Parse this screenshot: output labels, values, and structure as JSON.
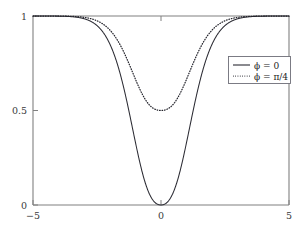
{
  "chart_data": {
    "type": "line",
    "title": "",
    "subtitle": "",
    "xlabel": "",
    "ylabel": "",
    "xlim": [
      -5,
      5
    ],
    "ylim": [
      0,
      1
    ],
    "xticks": [
      -5,
      0,
      5
    ],
    "xtick_labels": [
      "−5",
      "0",
      "5"
    ],
    "yticks": [
      0,
      0.5,
      1
    ],
    "ytick_labels": [
      "0",
      "0.5",
      "1"
    ],
    "grid": false,
    "legend_position": "upper right",
    "series": [
      {
        "name": "ϕ = 0",
        "style": "solid",
        "color": "#2b2b33",
        "minimum": 0.0,
        "minimum_at_x": 0,
        "asymptote": 1.0,
        "x": [
          -5.0,
          -4.75,
          -4.5,
          -4.25,
          -4.0,
          -3.75,
          -3.5,
          -3.25,
          -3.0,
          -2.75,
          -2.5,
          -2.25,
          -2.0,
          -1.75,
          -1.5,
          -1.25,
          -1.0,
          -0.9,
          -0.8,
          -0.7,
          -0.6,
          -0.5,
          -0.4,
          -0.3,
          -0.2,
          -0.1,
          0.0,
          0.1,
          0.2,
          0.3,
          0.4,
          0.5,
          0.6,
          0.7,
          0.8,
          0.9,
          1.0,
          1.25,
          1.5,
          1.75,
          2.0,
          2.25,
          2.5,
          2.75,
          3.0,
          3.25,
          3.5,
          3.75,
          4.0,
          4.25,
          4.5,
          4.75,
          5.0
        ],
        "y": [
          1.0,
          1.0,
          1.0,
          0.999,
          0.999,
          0.998,
          0.997,
          0.995,
          0.992,
          0.988,
          0.981,
          0.97,
          0.954,
          0.929,
          0.891,
          0.835,
          0.757,
          0.719,
          0.676,
          0.628,
          0.575,
          0.517,
          0.453,
          0.383,
          0.305,
          0.216,
          0.0,
          0.216,
          0.305,
          0.383,
          0.453,
          0.517,
          0.575,
          0.628,
          0.676,
          0.719,
          0.757,
          0.835,
          0.891,
          0.929,
          0.954,
          0.97,
          0.981,
          0.988,
          0.992,
          0.995,
          0.997,
          0.998,
          0.999,
          0.999,
          1.0,
          1.0,
          1.0
        ]
      },
      {
        "name": "ϕ = π/4",
        "style": "dotted",
        "color": "#23232b",
        "minimum": 0.5,
        "minimum_at_x": 0,
        "asymptote": 1.0,
        "x": [
          -5.0,
          -4.75,
          -4.5,
          -4.25,
          -4.0,
          -3.75,
          -3.5,
          -3.25,
          -3.0,
          -2.75,
          -2.5,
          -2.25,
          -2.0,
          -1.75,
          -1.5,
          -1.25,
          -1.0,
          -0.9,
          -0.8,
          -0.7,
          -0.6,
          -0.5,
          -0.4,
          -0.3,
          -0.2,
          -0.1,
          0.0,
          0.1,
          0.2,
          0.3,
          0.4,
          0.5,
          0.6,
          0.7,
          0.8,
          0.9,
          1.0,
          1.25,
          1.5,
          1.75,
          2.0,
          2.25,
          2.5,
          2.75,
          3.0,
          3.25,
          3.5,
          3.75,
          4.0,
          4.25,
          4.5,
          4.75,
          5.0
        ],
        "y": [
          1.0,
          1.0,
          0.999,
          0.999,
          0.998,
          0.997,
          0.995,
          0.992,
          0.988,
          0.982,
          0.973,
          0.959,
          0.939,
          0.909,
          0.868,
          0.812,
          0.742,
          0.711,
          0.679,
          0.645,
          0.612,
          0.58,
          0.55,
          0.527,
          0.51,
          0.502,
          0.5,
          0.502,
          0.51,
          0.527,
          0.55,
          0.58,
          0.612,
          0.645,
          0.679,
          0.711,
          0.742,
          0.812,
          0.868,
          0.909,
          0.939,
          0.959,
          0.973,
          0.982,
          0.988,
          0.992,
          0.995,
          0.997,
          0.998,
          0.999,
          0.999,
          1.0,
          1.0
        ]
      }
    ],
    "legend_entries": [
      {
        "label": "ϕ = 0",
        "style": "solid"
      },
      {
        "label": "ϕ = π/4",
        "style": "dotted"
      }
    ]
  },
  "axes": {
    "x_tick_labels": [
      "−5",
      "0",
      "5"
    ],
    "y_tick_labels": [
      "0",
      "0.5",
      "1"
    ]
  },
  "legend": {
    "entry_0_label": "ϕ = 0",
    "entry_1_label": "ϕ = π/4"
  },
  "colors": {
    "axis": "#808080",
    "curve_solid": "#2b2b33",
    "curve_dotted": "#23232b",
    "legend_border": "#6e6e78",
    "background": "#ffffff",
    "text": "#3a3a3a"
  }
}
